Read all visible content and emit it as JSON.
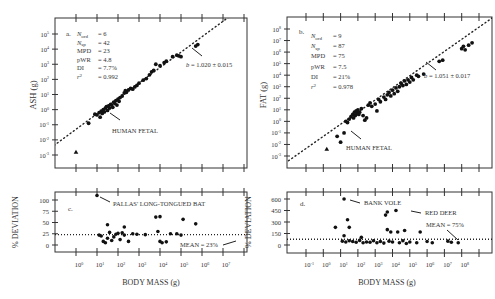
{
  "chart_data": [
    {
      "panel": "a",
      "type": "scatter",
      "title": "",
      "xlabel": "",
      "ylabel": "ASH (g)",
      "xscale": "log",
      "yscale": "log",
      "xlim_log10": [
        -1,
        8
      ],
      "ylim_log10": [
        -3.3,
        5.6
      ],
      "y_ticks": [
        "10^5",
        "10^4",
        "10^3",
        "10^2",
        "10^1",
        "10^0",
        "10^-1",
        "10^-2",
        "10^-3"
      ],
      "grid": false,
      "stats": [
        {
          "label": "N_ord",
          "value": "6"
        },
        {
          "label": "N_sp",
          "value": "42"
        },
        {
          "label": "MPD",
          "value": "23"
        },
        {
          "label": "pWR",
          "value": "4.8"
        },
        {
          "label": "DI",
          "value": "7.7%"
        },
        {
          "label": "r^2",
          "value": "0.992"
        }
      ],
      "panel_letter": "a.",
      "fit_label": "b = 1.020 ± 0.015",
      "fit": {
        "slope": 1.02,
        "intercept_log10": -1.3
      },
      "annotations": [
        "HUMAN FETAL"
      ],
      "points_log10": [
        [
          0.6,
          -0.9
        ],
        [
          0.9,
          -0.3
        ],
        [
          1.0,
          -0.35
        ],
        [
          1.1,
          -0.2
        ],
        [
          1.15,
          -0.5
        ],
        [
          1.2,
          -0.1
        ],
        [
          1.25,
          -0.25
        ],
        [
          1.3,
          0.0
        ],
        [
          1.35,
          -0.15
        ],
        [
          1.4,
          0.1
        ],
        [
          1.45,
          0.2
        ],
        [
          1.5,
          -0.05
        ],
        [
          1.55,
          0.25
        ],
        [
          1.6,
          0.1
        ],
        [
          1.65,
          0.35
        ],
        [
          1.7,
          0.3
        ],
        [
          1.75,
          0.15
        ],
        [
          1.8,
          0.5
        ],
        [
          1.85,
          0.4
        ],
        [
          1.9,
          0.6
        ],
        [
          1.95,
          0.3
        ],
        [
          2.0,
          0.7
        ],
        [
          2.05,
          0.55
        ],
        [
          2.1,
          0.8
        ],
        [
          2.2,
          0.9
        ],
        [
          2.3,
          1.1
        ],
        [
          2.35,
          1.25
        ],
        [
          2.4,
          1.15
        ],
        [
          2.5,
          1.3
        ],
        [
          2.6,
          1.4
        ],
        [
          2.7,
          1.35
        ],
        [
          2.8,
          1.5
        ],
        [
          2.9,
          1.6
        ],
        [
          3.0,
          1.75
        ],
        [
          3.2,
          1.95
        ],
        [
          3.35,
          2.05
        ],
        [
          3.5,
          2.3
        ],
        [
          3.6,
          2.5
        ],
        [
          3.7,
          2.6
        ],
        [
          3.8,
          3.0
        ],
        [
          4.0,
          2.9
        ],
        [
          4.2,
          3.1
        ],
        [
          4.3,
          3.2
        ],
        [
          4.6,
          3.5
        ],
        [
          4.8,
          3.6
        ],
        [
          4.9,
          3.55
        ],
        [
          5.0,
          3.5
        ],
        [
          5.7,
          4.2
        ],
        [
          5.8,
          4.3
        ]
      ],
      "triangle_points_log10": [
        [
          0.0,
          -2.8
        ]
      ]
    },
    {
      "panel": "b",
      "type": "scatter",
      "ylabel": "FAT (g)",
      "xscale": "log",
      "yscale": "log",
      "xlim_log10": [
        -2,
        9.5
      ],
      "ylim_log10": [
        -3.3,
        8.6
      ],
      "y_ticks": [
        "10^8",
        "10^7",
        "10^6",
        "10^5",
        "10^4",
        "10^3",
        "10^2",
        "10^1",
        "10^0",
        "10^-1",
        "10^-2",
        "10^-3"
      ],
      "grid": false,
      "stats": [
        {
          "label": "N_ord",
          "value": "9"
        },
        {
          "label": "N_sp",
          "value": "87"
        },
        {
          "label": "MPD",
          "value": "75"
        },
        {
          "label": "pWR",
          "value": "7.5"
        },
        {
          "label": "DI",
          "value": "21%"
        },
        {
          "label": "r^2",
          "value": "0.978"
        }
      ],
      "panel_letter": "b.",
      "fit_label": "b = 1.051 ± 0.017",
      "fit": {
        "slope": 1.051,
        "intercept_log10": -1.3
      },
      "annotations": [
        "HUMAN FETAL"
      ],
      "points_log10": [
        [
          0.8,
          -1.3
        ],
        [
          1.0,
          -1.8
        ],
        [
          1.2,
          -1.0
        ],
        [
          1.3,
          0.0
        ],
        [
          1.4,
          -0.1
        ],
        [
          1.5,
          0.2
        ],
        [
          1.6,
          0.4
        ],
        [
          1.7,
          0.6
        ],
        [
          1.75,
          0.3
        ],
        [
          1.8,
          0.8
        ],
        [
          1.85,
          0.5
        ],
        [
          1.9,
          0.9
        ],
        [
          1.95,
          0.7
        ],
        [
          2.0,
          1.0
        ],
        [
          2.05,
          0.6
        ],
        [
          2.1,
          0.8
        ],
        [
          2.2,
          1.1
        ],
        [
          2.3,
          0.5
        ],
        [
          2.4,
          0.1
        ],
        [
          2.5,
          0.3
        ],
        [
          2.6,
          1.4
        ],
        [
          2.7,
          1.6
        ],
        [
          2.8,
          1.3
        ],
        [
          3.0,
          1.5
        ],
        [
          3.1,
          0.9
        ],
        [
          3.2,
          1.9
        ],
        [
          3.3,
          1.7
        ],
        [
          3.5,
          2.1
        ],
        [
          3.6,
          1.9
        ],
        [
          3.7,
          2.3
        ],
        [
          3.8,
          2.5
        ],
        [
          3.9,
          2.2
        ],
        [
          4.0,
          2.7
        ],
        [
          4.1,
          2.4
        ],
        [
          4.2,
          2.9
        ],
        [
          4.3,
          2.6
        ],
        [
          4.4,
          3.0
        ],
        [
          4.5,
          3.3
        ],
        [
          4.6,
          3.1
        ],
        [
          4.7,
          3.5
        ],
        [
          4.8,
          3.2
        ],
        [
          4.9,
          3.6
        ],
        [
          5.0,
          3.4
        ],
        [
          5.1,
          3.8
        ],
        [
          5.2,
          3.6
        ],
        [
          5.4,
          4.0
        ],
        [
          5.5,
          3.9
        ],
        [
          5.8,
          4.1
        ],
        [
          6.7,
          5.2
        ],
        [
          6.9,
          5.3
        ],
        [
          8.0,
          6.3
        ],
        [
          8.1,
          6.5
        ],
        [
          8.2,
          6.2
        ],
        [
          8.4,
          6.6
        ],
        [
          8.6,
          6.8
        ]
      ],
      "triangle_points_log10": [
        [
          0.2,
          -2.4
        ]
      ]
    },
    {
      "panel": "c",
      "type": "scatter",
      "xlabel": "BODY  MASS (g)",
      "ylabel": "% DEVIATION",
      "xscale": "log",
      "x_ticks": [
        "10^0",
        "10^1",
        "10^2",
        "10^3",
        "10^4",
        "10^5",
        "10^6",
        "10^7"
      ],
      "y_ticks": [
        0,
        25,
        50,
        75,
        100
      ],
      "ylim": [
        -5,
        115
      ],
      "mean_line": 23,
      "mean_label": "MEAN = 23%",
      "panel_letter": "c.",
      "annotations": [
        "PALLAS' LONG-TONGUED BAT"
      ],
      "points": [
        [
          1.0,
          110
        ],
        [
          1.1,
          22
        ],
        [
          1.2,
          20
        ],
        [
          1.3,
          8
        ],
        [
          1.4,
          5
        ],
        [
          1.5,
          45
        ],
        [
          1.5,
          15
        ],
        [
          1.6,
          28
        ],
        [
          1.7,
          10
        ],
        [
          1.8,
          18
        ],
        [
          1.9,
          24
        ],
        [
          2.0,
          26
        ],
        [
          2.1,
          12
        ],
        [
          2.2,
          27
        ],
        [
          2.3,
          40
        ],
        [
          2.3,
          22
        ],
        [
          2.5,
          8
        ],
        [
          2.7,
          25
        ],
        [
          2.9,
          24
        ],
        [
          3.3,
          23
        ],
        [
          3.8,
          62
        ],
        [
          3.9,
          30
        ],
        [
          4.0,
          63
        ],
        [
          4.0,
          8
        ],
        [
          4.1,
          5
        ],
        [
          4.3,
          7
        ],
        [
          4.5,
          25
        ],
        [
          4.8,
          25
        ],
        [
          5.0,
          22
        ],
        [
          5.1,
          57
        ],
        [
          5.7,
          47
        ]
      ]
    },
    {
      "panel": "d",
      "type": "scatter",
      "xlabel": "BODY MASS (g)",
      "ylabel": "% DEVIATION",
      "xscale": "log",
      "x_ticks": [
        "10^-1",
        "10^0",
        "10^1",
        "10^2",
        "10^3",
        "10^4",
        "10^5",
        "10^6",
        "10^7",
        "10^8"
      ],
      "y_ticks": [
        0,
        150,
        300,
        450,
        600
      ],
      "ylim": [
        -30,
        680
      ],
      "mean_line": 75,
      "mean_label": "MEAN = 75%",
      "panel_letter": "d.",
      "annotations": [
        "BANK VOLE",
        "RED DEER"
      ],
      "points": [
        [
          0.7,
          230
        ],
        [
          1.2,
          600
        ],
        [
          1.2,
          120
        ],
        [
          1.4,
          330
        ],
        [
          1.5,
          230
        ],
        [
          2.2,
          100
        ],
        [
          3.6,
          390
        ],
        [
          3.7,
          430
        ],
        [
          3.7,
          200
        ],
        [
          4.2,
          450
        ],
        [
          3.9,
          170
        ],
        [
          4.3,
          170
        ],
        [
          4.7,
          190
        ],
        [
          5.6,
          170
        ],
        [
          1.1,
          50
        ],
        [
          1.3,
          40
        ],
        [
          1.5,
          55
        ],
        [
          1.7,
          45
        ],
        [
          1.9,
          35
        ],
        [
          2.1,
          60
        ],
        [
          2.3,
          30
        ],
        [
          2.5,
          40
        ],
        [
          2.7,
          35
        ],
        [
          2.9,
          55
        ],
        [
          3.1,
          30
        ],
        [
          3.3,
          45
        ],
        [
          3.5,
          25
        ],
        [
          3.8,
          50
        ],
        [
          4.0,
          40
        ],
        [
          4.4,
          30
        ],
        [
          4.6,
          55
        ],
        [
          4.8,
          20
        ],
        [
          5.0,
          40
        ],
        [
          5.4,
          30
        ],
        [
          6.0,
          45
        ],
        [
          6.3,
          30
        ],
        [
          7.2,
          50
        ],
        [
          7.4,
          35
        ],
        [
          7.8,
          30
        ]
      ]
    }
  ]
}
